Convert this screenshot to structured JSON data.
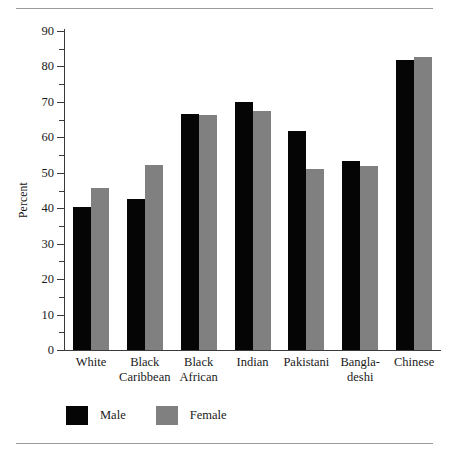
{
  "figure": {
    "background": "#ffffff",
    "rules": {
      "top": "horizontal-rule-top",
      "bottom": "horizontal-rule-bottom",
      "color": "#9a9a9a"
    }
  },
  "chart_data": {
    "type": "bar",
    "title": "",
    "subtitle": "",
    "xlabel": "",
    "ylabel": "Percent",
    "categories": [
      "White",
      "Black Caribbean",
      "Black African",
      "Indian",
      "Pakistani",
      "Bangla-deshi",
      "Chinese"
    ],
    "category_lines": [
      [
        "White",
        ""
      ],
      [
        "Black",
        "Caribbean"
      ],
      [
        "Black",
        "African"
      ],
      [
        "Indian",
        ""
      ],
      [
        "Pakistani",
        ""
      ],
      [
        "Bangla-",
        "deshi"
      ],
      [
        "Chinese",
        ""
      ]
    ],
    "series": [
      {
        "name": "Male",
        "color": "#050505",
        "values": [
          40.3,
          42.5,
          66.5,
          70.1,
          61.8,
          53.2,
          81.8
        ]
      },
      {
        "name": "Female",
        "color": "#808080",
        "values": [
          45.6,
          52.2,
          66.4,
          67.3,
          51.2,
          52.0,
          82.6
        ]
      }
    ],
    "ylim": [
      0,
      90
    ],
    "yticks": [
      0,
      10,
      20,
      30,
      40,
      50,
      60,
      70,
      80,
      90
    ],
    "ytick_labels": [
      "0",
      "10",
      "20",
      "30",
      "40",
      "50",
      "60",
      "70",
      "80",
      "90"
    ],
    "yminor_ticks": [
      5,
      15,
      25,
      35,
      45,
      55,
      65,
      75,
      85
    ],
    "grid": false,
    "legend": {
      "position": "bottom-left",
      "entries": [
        {
          "label": "Male",
          "color": "#050505"
        },
        {
          "label": "Female",
          "color": "#808080"
        }
      ]
    }
  }
}
